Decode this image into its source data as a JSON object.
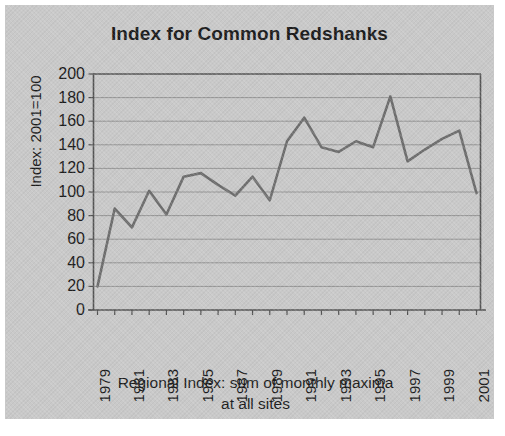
{
  "figure": {
    "background_color": "#c9c9c9",
    "line_color": "#6e6e6e",
    "text_color": "#1c1c1c"
  },
  "chart_data": {
    "type": "line",
    "title": "Index for Common Redshanks",
    "ylabel": "Index: 2001=100",
    "xlabel": "Regional Index: sum of monthly maxima at all sites",
    "xlabel_line1": "Regional Index: sum of monthly maxima",
    "xlabel_line2": "at all sites",
    "grid": true,
    "legend": "none",
    "xlim": [
      1979,
      2001
    ],
    "ylim": [
      0,
      200
    ],
    "ytick_step": 20,
    "yticks": [
      0,
      20,
      40,
      60,
      80,
      100,
      120,
      140,
      160,
      180,
      200
    ],
    "ytick_labels": [
      "0",
      "20",
      "40",
      "60",
      "80",
      "100",
      "120",
      "140",
      "160",
      "180",
      "200"
    ],
    "xticks": [
      1979,
      1981,
      1983,
      1985,
      1987,
      1989,
      1991,
      1993,
      1995,
      1997,
      1999,
      2001
    ],
    "xtick_labels": [
      "1979",
      "1981",
      "1983",
      "1985",
      "1987",
      "1989",
      "1991",
      "1993",
      "1995",
      "1997",
      "1999",
      "2001"
    ],
    "x": [
      1979,
      1980,
      1981,
      1982,
      1983,
      1984,
      1985,
      1986,
      1987,
      1988,
      1989,
      1990,
      1991,
      1992,
      1993,
      1994,
      1995,
      1996,
      1997,
      1998,
      1999,
      2000,
      2001
    ],
    "values": [
      20,
      86,
      70,
      101,
      81,
      113,
      116,
      106,
      97,
      113,
      93,
      143,
      163,
      138,
      134,
      143,
      138,
      181,
      126,
      136,
      145,
      152,
      99
    ],
    "series": [
      {
        "name": "Common Redshank index",
        "values": [
          20,
          86,
          70,
          101,
          81,
          113,
          116,
          106,
          97,
          113,
          93,
          143,
          163,
          138,
          134,
          143,
          138,
          181,
          126,
          136,
          145,
          152,
          99
        ]
      }
    ]
  }
}
